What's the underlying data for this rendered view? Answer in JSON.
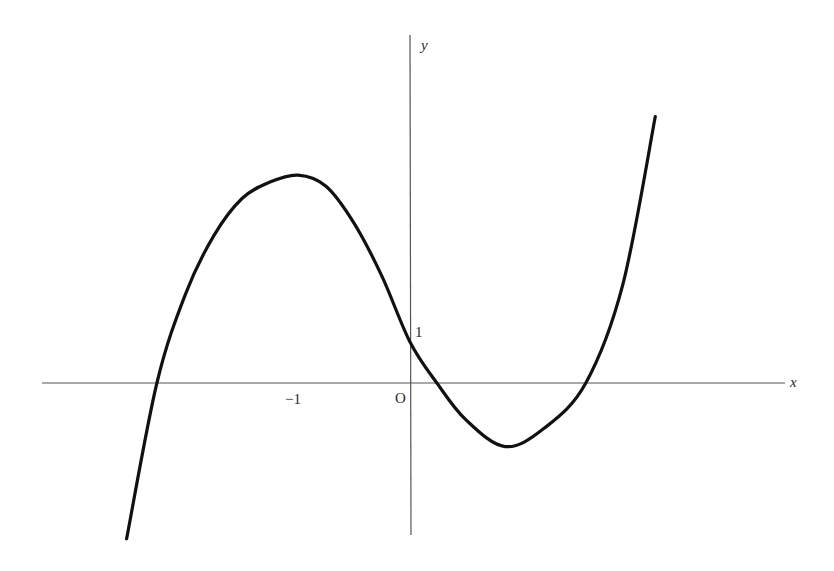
{
  "chart_data": {
    "type": "line",
    "title": "",
    "xlabel": "x",
    "ylabel": "y",
    "origin_label": "O",
    "tick_labels": {
      "x": [
        {
          "value": -1,
          "label": "−1"
        }
      ],
      "y": [
        {
          "value": 1,
          "label": "1"
        }
      ]
    },
    "grid": false,
    "legend": null,
    "key_points": {
      "local_max": {
        "x": -1,
        "y": 5
      },
      "y_intercept": {
        "x": 0,
        "y": 1
      },
      "local_min": {
        "x": 0.85,
        "y": -1.55
      },
      "roots": [
        -2.26,
        0.24,
        1.57
      ]
    },
    "series": [
      {
        "name": "curve",
        "x": [
          -2.53,
          -2.26,
          -2.0,
          -1.75,
          -1.5,
          -1.25,
          -1.0,
          -0.75,
          -0.5,
          -0.25,
          0.0,
          0.24,
          0.5,
          0.85,
          1.2,
          1.57,
          1.9,
          2.19
        ],
        "y": [
          -3.8,
          0.0,
          2.2,
          3.6,
          4.5,
          4.9,
          5.07,
          4.8,
          3.9,
          2.6,
          1.0,
          0.0,
          -0.9,
          -1.55,
          -1.1,
          0.0,
          2.4,
          6.5
        ]
      }
    ],
    "axis_pixel_frame": {
      "origin_px": [
        410,
        383
      ],
      "x_px_per_unit": 112,
      "y_px_per_unit": 41
    }
  },
  "labels": {
    "x_axis": "x",
    "y_axis": "y",
    "origin": "O",
    "x_tick_minus_one": "−1",
    "y_tick_one": "1"
  }
}
